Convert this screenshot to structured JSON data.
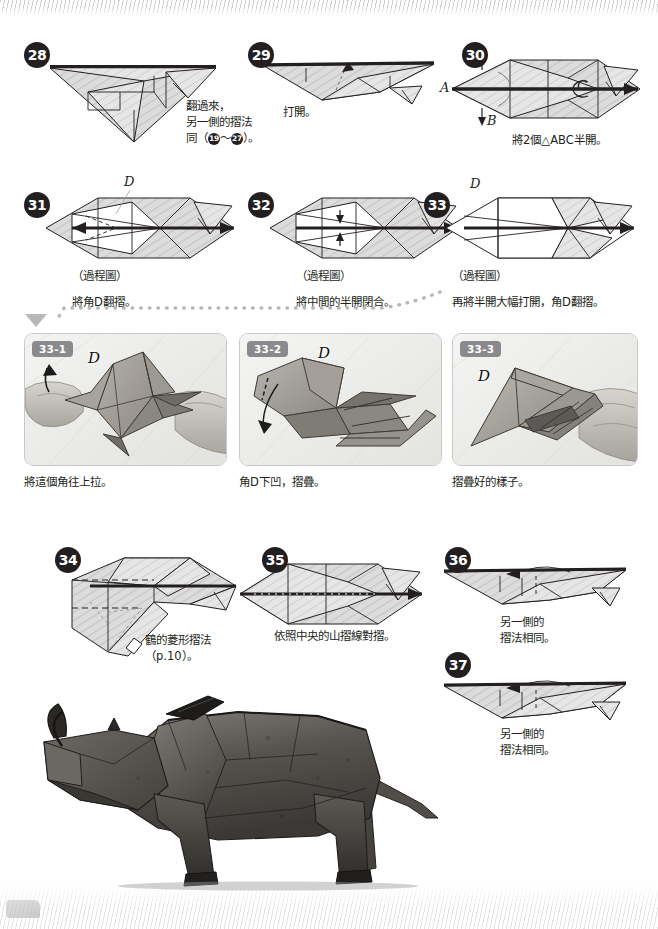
{
  "page": {
    "language": "zh-Hant",
    "accent_color": "#231f20",
    "panel_tag_color": "#8a8a8d",
    "paper_fill": "#d9d9d9"
  },
  "steps": [
    {
      "id": "28",
      "number": "28",
      "caption": "翻過來，\n另一側的摺法\n同（",
      "caption_tail": "）。",
      "ref_from": "19",
      "ref_to": "27",
      "caption_plain": "翻過來，另一側的摺法同（19～27）。"
    },
    {
      "id": "29",
      "number": "29",
      "caption": "打開。"
    },
    {
      "id": "30",
      "number": "30",
      "caption": "將2個△ABC半開。",
      "labels": [
        "A",
        "B",
        "C"
      ]
    },
    {
      "id": "31",
      "number": "31",
      "caption_note": "（過程圖）",
      "caption": "將角D翻摺。",
      "labels": [
        "D"
      ]
    },
    {
      "id": "32",
      "number": "32",
      "caption_note": "（過程圖）",
      "caption": "將中間的半開閉合。"
    },
    {
      "id": "33",
      "number": "33",
      "caption_note": "（過程圖）",
      "caption": "再將半開大幅打開，角D翻摺。",
      "labels": [
        "D"
      ]
    },
    {
      "id": "34",
      "number": "34",
      "caption": "鶴的菱形摺法\n（p.10）。"
    },
    {
      "id": "35",
      "number": "35",
      "caption": "依照中央的山摺線對摺。"
    },
    {
      "id": "36",
      "number": "36",
      "caption": "另一側的\n摺法相同。"
    },
    {
      "id": "37",
      "number": "37",
      "caption": "另一側的\n摺法相同。"
    }
  ],
  "photo_panels": [
    {
      "id": "33-1",
      "tag": "33-1",
      "caption": "將這個角往上拉。",
      "label": "D"
    },
    {
      "id": "33-2",
      "tag": "33-2",
      "caption": "角D下凹，摺疊。",
      "label": "D"
    },
    {
      "id": "33-3",
      "tag": "33-3",
      "caption": "摺疊好的樣子。",
      "label": "D"
    }
  ],
  "final_photo": {
    "name": "origami-rhinoceros-photo",
    "alt": "完成的摺紙犀牛"
  }
}
